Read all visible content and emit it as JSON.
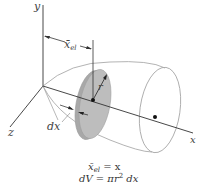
{
  "diagram": {
    "type": "volume-of-revolution-disk-element",
    "axes": {
      "x_label": "x",
      "y_label": "y",
      "z_label": "z"
    },
    "labels": {
      "centroid_distance": "x̄",
      "centroid_distance_sub": "el",
      "radius": "r",
      "thickness": "dx"
    },
    "equations": {
      "line1_lhs": "x̄",
      "line1_sub": "el",
      "line1_rhs": " = x",
      "line2": "dV = πr",
      "line2_sup": "2",
      "line2_tail": " dx"
    },
    "colors": {
      "disk_fill": "#b8b8b8",
      "disk_edge": "#9a9a9a",
      "shell_outline": "#aaaaaa",
      "axis": "#333333",
      "point": "#111111"
    }
  }
}
